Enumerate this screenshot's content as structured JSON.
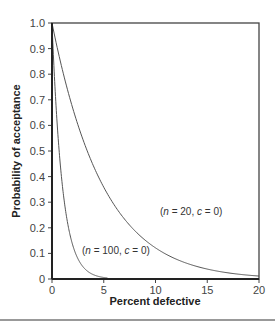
{
  "chart_data": {
    "type": "line",
    "title": "",
    "xlabel": "Percent defective",
    "ylabel": "Probability of acceptance",
    "xlim": [
      0,
      20
    ],
    "ylim": [
      0,
      1.0
    ],
    "x_ticks": [
      "0",
      "5",
      "10",
      "15",
      "20"
    ],
    "y_ticks": [
      "0",
      "0.1",
      "0.2",
      "0.3",
      "0.4",
      "0.5",
      "0.6",
      "0.7",
      "0.8",
      "0.9",
      "1.0"
    ],
    "grid": false,
    "legend": null,
    "series": [
      {
        "name": "(n = 20, c = 0)",
        "x": [
          0,
          1,
          2,
          3,
          4,
          5,
          6,
          8,
          10,
          12,
          15,
          20
        ],
        "values": [
          1.0,
          0.818,
          0.668,
          0.544,
          0.442,
          0.358,
          0.29,
          0.189,
          0.122,
          0.078,
          0.039,
          0.012
        ]
      },
      {
        "name": "(n = 100, c = 0)",
        "x": [
          0,
          0.5,
          1,
          1.5,
          2,
          3,
          4,
          5
        ],
        "values": [
          1.0,
          0.606,
          0.366,
          0.221,
          0.133,
          0.048,
          0.017,
          0.006
        ]
      }
    ],
    "annotations": [
      {
        "text": "(n = 20, c = 0)",
        "x": 12,
        "y": 0.33
      },
      {
        "text": "(n = 100, c = 0)",
        "x": 5.5,
        "y": 0.12
      }
    ]
  },
  "labels": {
    "xlabel": "Percent defective",
    "ylabel": "Probability of acceptance",
    "ann1": "(n = 20, c = 0)",
    "ann2": "(n = 100, c = 0)"
  }
}
